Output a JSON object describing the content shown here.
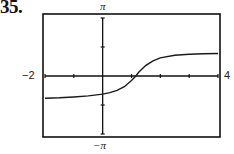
{
  "problem_number": "35.",
  "axis_labels": {
    "y_max": "π",
    "y_min": "−π",
    "x_min": "−2",
    "x_max": "4"
  },
  "chart_data": {
    "type": "line",
    "title": "",
    "xlabel": "",
    "ylabel": "",
    "xlim": [
      -2,
      4
    ],
    "ylim": [
      -3.14159,
      3.14159
    ],
    "grid": false,
    "legend": null,
    "x_ticks": [
      -2,
      -1,
      0,
      1,
      2,
      3,
      4
    ],
    "y_ticks": [
      -3.14159,
      -1.5708,
      0,
      1.5708,
      3.14159
    ],
    "tick_labels": {
      "x": [
        "−2",
        "4"
      ],
      "y": [
        "−π",
        "π"
      ]
    },
    "series": [
      {
        "name": "f(x)",
        "x": [
          -2.0,
          -1.5,
          -1.0,
          -0.5,
          0.0,
          0.25,
          0.5,
          0.75,
          1.0,
          1.15,
          1.25,
          1.5,
          1.75,
          2.0,
          2.5,
          3.0,
          3.5,
          4.0
        ],
        "y": [
          -1.2,
          -1.18,
          -1.14,
          -1.08,
          -0.98,
          -0.9,
          -0.78,
          -0.58,
          -0.25,
          0.0,
          0.2,
          0.58,
          0.82,
          0.98,
          1.12,
          1.18,
          1.21,
          1.22
        ]
      }
    ]
  },
  "colors": {
    "axes": "#111111",
    "curve": "#1a1a1a",
    "frame": "#111111"
  }
}
